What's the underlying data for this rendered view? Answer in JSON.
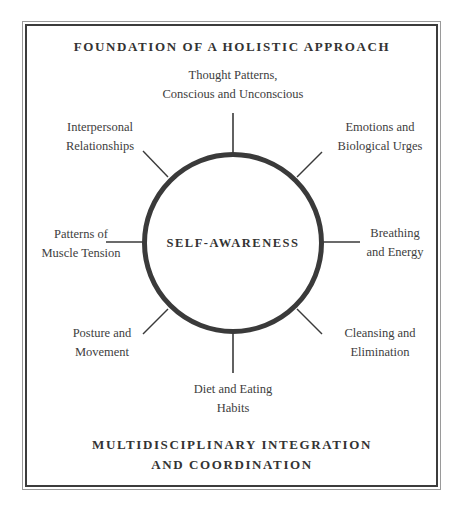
{
  "diagram": {
    "title": "FOUNDATION OF A HOLISTIC APPROACH",
    "footer": {
      "line1": "MULTIDISCIPLINARY INTEGRATION",
      "line2": "AND COORDINATION"
    },
    "center": {
      "label": "SELF-AWARENESS",
      "shape": "circle",
      "stroke_color": "#3a3a3a"
    },
    "nodes": [
      {
        "position": "top",
        "line1": "Thought Patterns,",
        "line2": "Conscious and Unconscious"
      },
      {
        "position": "top-right",
        "line1": "Emotions and",
        "line2": "Biological Urges"
      },
      {
        "position": "right",
        "line1": "Breathing",
        "line2": "and Energy"
      },
      {
        "position": "bottom-right",
        "line1": "Cleansing and",
        "line2": "Elimination"
      },
      {
        "position": "bottom",
        "line1": "Diet and Eating",
        "line2": "Habits"
      },
      {
        "position": "bottom-left",
        "line1": "Posture and",
        "line2": "Movement"
      },
      {
        "position": "left",
        "line1": "Patterns of",
        "line2": "Muscle Tension"
      },
      {
        "position": "top-left",
        "line1": "Interpersonal",
        "line2": "Relationships"
      }
    ]
  }
}
